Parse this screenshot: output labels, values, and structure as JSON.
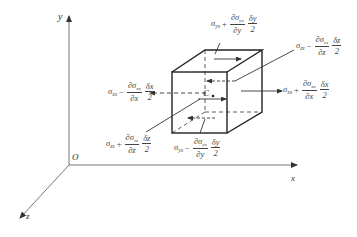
{
  "diagram": {
    "type": "stress-element-free-body",
    "axes": {
      "origin_label": "O",
      "x_label": "x",
      "y_label": "y",
      "z_label": "z"
    },
    "centroid_label": "C",
    "stress_labels": {
      "top_shear_yx": {
        "sigma": "σ",
        "sub": "yx",
        "op": "+",
        "num_d": "∂σ",
        "num_sub": "yx",
        "den": "∂y",
        "half_num": "δy",
        "half_den": "2"
      },
      "back_zx": {
        "sigma": "σ",
        "sub": "zx",
        "op": "−",
        "num_d": "∂σ",
        "num_sub": "zx",
        "den": "∂z",
        "half_num": "δz",
        "half_den": "2"
      },
      "right_xx": {
        "sigma": "σ",
        "sub": "xx",
        "op": "+",
        "num_d": "∂σ",
        "num_sub": "xx",
        "den": "∂x",
        "half_num": "δx",
        "half_den": "2"
      },
      "left_xx": {
        "sigma": "σ",
        "sub": "xx",
        "op": "−",
        "num_d": "∂σ",
        "num_sub": "xx",
        "den": "∂x",
        "half_num": "δx",
        "half_den": "2"
      },
      "front_zx": {
        "sigma": "σ",
        "sub": "zx",
        "op": "+",
        "num_d": "∂σ",
        "num_sub": "zx",
        "den": "∂z",
        "half_num": "δz",
        "half_den": "2"
      },
      "bottom_shear_yx": {
        "sigma": "σ",
        "sub": "yx",
        "op": "−",
        "num_d": "∂σ",
        "num_sub": "yx",
        "den": "∂y",
        "half_num": "δy",
        "half_den": "2"
      }
    },
    "colors": {
      "line": "#333333",
      "axis": "#555555",
      "text": "#444444",
      "background": "#ffffff"
    }
  }
}
